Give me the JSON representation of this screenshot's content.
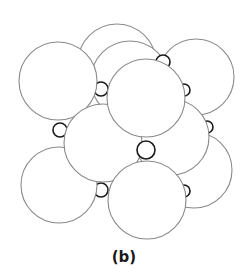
{
  "caption": "(b)",
  "diagram": {
    "large_spheres": [
      {
        "id": "back-top",
        "cx": 117,
        "cy": 63,
        "r": 39
      },
      {
        "id": "back-right-lower",
        "cx": 194,
        "cy": 170,
        "r": 38
      },
      {
        "id": "back-upper-mid",
        "cx": 130,
        "cy": 80,
        "r": 39
      },
      {
        "id": "top-right",
        "cx": 196,
        "cy": 77,
        "r": 38
      },
      {
        "id": "top-left",
        "cx": 58,
        "cy": 81,
        "r": 39
      },
      {
        "id": "middle-right",
        "cx": 171,
        "cy": 137,
        "r": 38
      },
      {
        "id": "bottom-left",
        "cx": 59,
        "cy": 185,
        "r": 38
      },
      {
        "id": "middle-left",
        "cx": 103,
        "cy": 143,
        "r": 39
      },
      {
        "id": "center-top",
        "cx": 146,
        "cy": 98,
        "r": 39
      },
      {
        "id": "bottom-front",
        "cx": 147,
        "cy": 200,
        "r": 39
      }
    ],
    "small_spheres": [
      {
        "id": "s1",
        "cx": 101,
        "cy": 89,
        "r": 7
      },
      {
        "id": "s2",
        "cx": 60,
        "cy": 130,
        "r": 7
      },
      {
        "id": "s3",
        "cx": 101,
        "cy": 190,
        "r": 7
      },
      {
        "id": "s4",
        "cx": 146,
        "cy": 150,
        "r": 9
      },
      {
        "id": "s5",
        "cx": 163,
        "cy": 62,
        "r": 7
      },
      {
        "id": "s6",
        "cx": 184,
        "cy": 90,
        "r": 6
      },
      {
        "id": "s7",
        "cx": 207,
        "cy": 127,
        "r": 6
      },
      {
        "id": "s8",
        "cx": 184,
        "cy": 191,
        "r": 6
      }
    ],
    "colors": {
      "large_stroke": "#8a8a8a",
      "small_stroke": "#1a1a1a",
      "background": "#ffffff"
    }
  }
}
